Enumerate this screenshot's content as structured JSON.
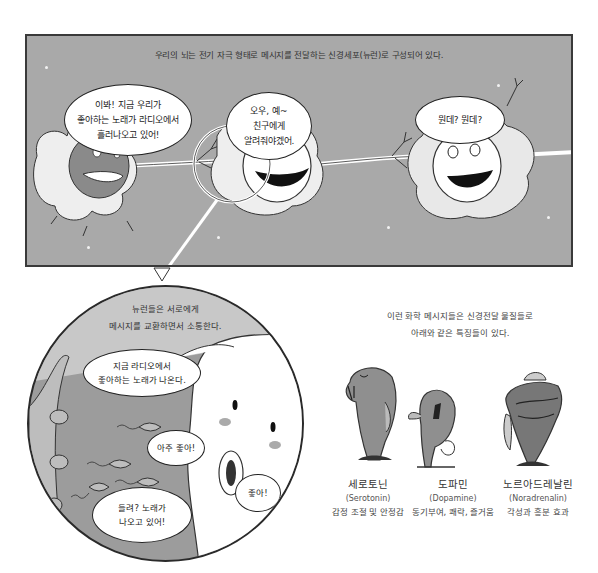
{
  "top_panel": {
    "caption": "우리의 뇌는 전기 자극 형태로 메시지를 전달하는 신경세포(뉴런)로 구성되어 있다.",
    "background_color": "#a9a9a9",
    "bubbles": [
      {
        "speaker": "left-neuron",
        "lines": [
          "이봐! 지금 우리가",
          "좋아하는 노래가 라디오에서",
          "흘러나오고 있어!"
        ]
      },
      {
        "speaker": "middle-neuron",
        "lines": [
          "오우, 예~",
          "친구에게",
          "알려줘야겠어."
        ]
      },
      {
        "speaker": "right-neuron",
        "lines": [
          "뭔데? 뭔데?"
        ]
      }
    ]
  },
  "zoom_panel": {
    "caption_lines": [
      "뉴런들은 서로에게",
      "메시지를 교환하면서 소통한다."
    ],
    "bubbles": [
      {
        "lines": [
          "지금 라디오에서",
          "좋아하는 노래가 나온다."
        ]
      },
      {
        "lines": [
          "아주 좋아!"
        ]
      },
      {
        "lines": [
          "들려? 노래가",
          "나오고 있어!"
        ]
      },
      {
        "lines": [
          "좋아!"
        ]
      }
    ]
  },
  "neurotransmitters": {
    "intro_lines": [
      "이런 화학 메시지들은 신경전달 물질들로",
      "아래와 같은 특징들이 있다."
    ],
    "items": [
      {
        "name_ko": "세로토닌",
        "name_en": "(Serotonin)",
        "description": "감정 조절 및 안정감"
      },
      {
        "name_ko": "도파민",
        "name_en": "(Dopamine)",
        "description": "동기부여, 쾌락, 즐거움"
      },
      {
        "name_ko": "노르아드레날린",
        "name_en": "(Noradrenalin)",
        "description": "각성과 흥분 효과"
      }
    ]
  }
}
